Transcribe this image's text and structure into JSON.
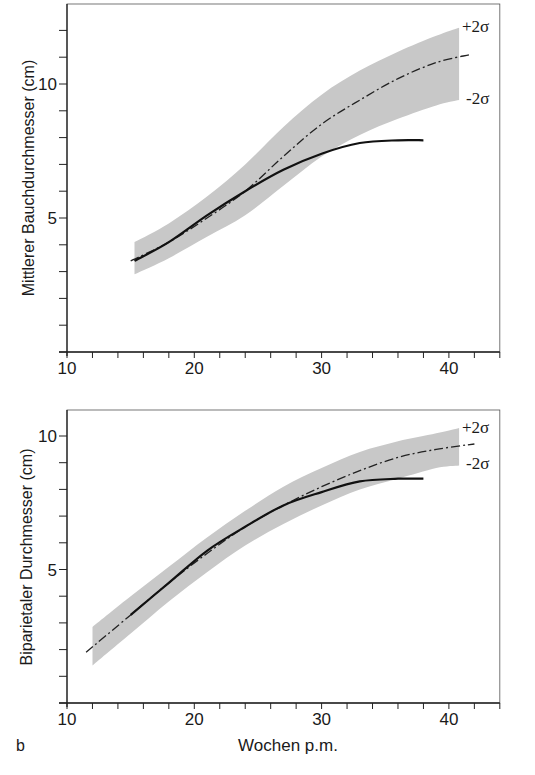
{
  "figure": {
    "panel_label": "b",
    "xlabel": "Wochen p.m."
  },
  "chart_data": [
    {
      "type": "line",
      "title": "",
      "xlabel": "",
      "ylabel": "Mittlerer Bauchdurchmesser (cm)",
      "xlim": [
        10,
        44
      ],
      "ylim": [
        0,
        13
      ],
      "x_ticks_major": [
        10,
        20,
        30,
        40
      ],
      "x_ticks_minor_step": 2,
      "y_ticks_major": [
        5,
        10
      ],
      "y_ticks_minor_step": 1,
      "grid": false,
      "band_labels": {
        "upper": "+2σ",
        "lower": "-2σ"
      },
      "series": [
        {
          "name": "reference mean",
          "style": "dash-dot",
          "x": [
            15,
            18,
            21,
            24,
            27,
            30,
            33,
            36,
            39,
            41.7
          ],
          "values": [
            3.4,
            4.1,
            5.0,
            6.0,
            7.3,
            8.5,
            9.4,
            10.2,
            10.8,
            11.1
          ]
        },
        {
          "name": "±2σ band upper",
          "style": "band",
          "x": [
            15.3,
            18,
            21,
            24,
            27,
            30,
            33,
            36,
            39,
            40.8
          ],
          "values": [
            4.1,
            4.8,
            5.8,
            7.0,
            8.4,
            9.6,
            10.5,
            11.2,
            11.8,
            12.1
          ]
        },
        {
          "name": "±2σ band lower",
          "style": "band",
          "x": [
            15.3,
            18,
            21,
            24,
            27,
            30,
            33,
            36,
            39,
            40.8
          ],
          "values": [
            2.9,
            3.5,
            4.3,
            5.1,
            6.2,
            7.3,
            8.1,
            8.7,
            9.2,
            9.4
          ]
        },
        {
          "name": "observed",
          "style": "solid",
          "x": [
            15.3,
            18,
            21,
            24,
            27,
            30,
            33,
            36,
            38
          ],
          "values": [
            3.4,
            4.1,
            5.1,
            6.0,
            6.8,
            7.4,
            7.8,
            7.9,
            7.9
          ]
        }
      ]
    },
    {
      "type": "line",
      "title": "",
      "xlabel": "Wochen p.m.",
      "ylabel": "Biparietaler Durchmesser (cm)",
      "xlim": [
        10,
        44
      ],
      "ylim": [
        0,
        11
      ],
      "x_ticks_major": [
        10,
        20,
        30,
        40
      ],
      "x_ticks_minor_step": 2,
      "y_ticks_major": [
        5,
        10
      ],
      "y_ticks_minor_step": 1,
      "grid": false,
      "band_labels": {
        "upper": "+2σ",
        "lower": "-2σ"
      },
      "series": [
        {
          "name": "reference mean",
          "style": "dash-dot",
          "x": [
            11.5,
            15,
            18,
            21,
            24,
            27,
            30,
            33,
            36,
            39,
            42
          ],
          "values": [
            1.9,
            3.3,
            4.5,
            5.6,
            6.6,
            7.4,
            8.1,
            8.7,
            9.2,
            9.5,
            9.7
          ]
        },
        {
          "name": "±2σ band upper",
          "style": "band",
          "x": [
            12,
            15,
            18,
            21,
            24,
            27,
            30,
            33,
            36,
            39,
            40.8
          ],
          "values": [
            2.85,
            4.0,
            5.1,
            6.2,
            7.2,
            8.1,
            8.8,
            9.4,
            9.8,
            10.1,
            10.3
          ]
        },
        {
          "name": "±2σ band lower",
          "style": "band",
          "x": [
            12,
            15,
            18,
            21,
            24,
            27,
            30,
            33,
            36,
            39,
            40.8
          ],
          "values": [
            1.4,
            2.6,
            3.8,
            4.9,
            5.9,
            6.7,
            7.4,
            8.0,
            8.4,
            8.8,
            8.9
          ]
        },
        {
          "name": "observed",
          "style": "solid",
          "x": [
            15,
            18,
            21,
            24,
            27,
            30,
            33,
            36,
            38
          ],
          "values": [
            3.3,
            4.5,
            5.7,
            6.6,
            7.4,
            7.9,
            8.3,
            8.4,
            8.4
          ]
        }
      ]
    }
  ]
}
